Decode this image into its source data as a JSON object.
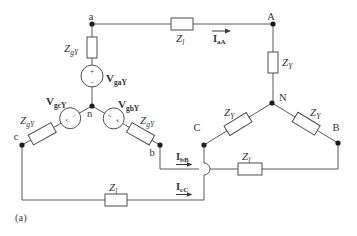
{
  "figure": {
    "caption": "(a)"
  },
  "colors": {
    "background": "#ffffff",
    "wire": "#5a5a5a",
    "component_stroke": "#4f4f4f",
    "component_fill": "#ffffff",
    "node_dot": "#1c1c1c",
    "text": "#333333"
  },
  "nodes": {
    "source_a": "a",
    "source_b": "b",
    "source_c": "c",
    "source_neutral": "n",
    "load_a": "A",
    "load_b": "B",
    "load_c": "C",
    "load_neutral": "N"
  },
  "labels": {
    "source_impedance": {
      "main": "Z",
      "sub": "gY"
    },
    "line_impedance": {
      "main": "Z",
      "sub": "l"
    },
    "load_impedance": {
      "main": "Z",
      "sub": "Y"
    },
    "source_voltage_a": {
      "main": "V",
      "sub": "gaY"
    },
    "source_voltage_b": {
      "main": "V",
      "sub": "gbY"
    },
    "source_voltage_c": {
      "main": "V",
      "sub": "gcY"
    },
    "current_aA": {
      "main": "I",
      "sub": "aA"
    },
    "current_bB": {
      "main": "I",
      "sub": "bB"
    },
    "current_cC": {
      "main": "I",
      "sub": "cC"
    },
    "polarity": {
      "plus": "+",
      "minus": "−"
    }
  }
}
